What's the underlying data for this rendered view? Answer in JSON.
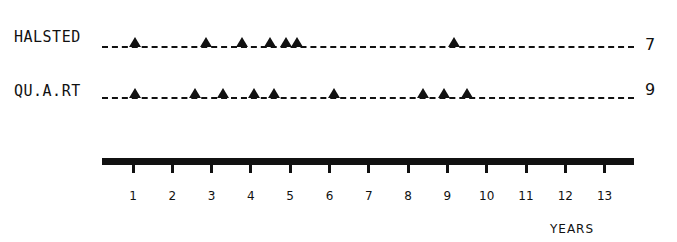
{
  "chart_data": {
    "type": "scatter",
    "title": "",
    "xlabel": "YEARS",
    "ylabel": "",
    "xlim": [
      0.2,
      13.7
    ],
    "x_ticks": [
      1,
      2,
      3,
      4,
      5,
      6,
      7,
      8,
      9,
      10,
      11,
      12,
      13
    ],
    "marker": "triangle",
    "grid": false,
    "legend": "none",
    "series": [
      {
        "name": "HALSTED",
        "count": 7,
        "x": [
          1.05,
          2.86,
          3.77,
          4.49,
          4.89,
          5.17,
          9.17
        ]
      },
      {
        "name": "QU.A.RT",
        "count": 9,
        "x": [
          1.05,
          2.58,
          3.29,
          4.08,
          4.59,
          6.11,
          8.38,
          8.91,
          9.5
        ]
      }
    ]
  },
  "rows": [
    {
      "label": "HALSTED",
      "count": "7"
    },
    {
      "label": "QU.A.RT",
      "count": "9"
    }
  ],
  "axis": {
    "ticks": [
      "1",
      "2",
      "3",
      "4",
      "5",
      "6",
      "7",
      "8",
      "9",
      "10",
      "11",
      "12",
      "13"
    ],
    "label": "YEARS"
  }
}
